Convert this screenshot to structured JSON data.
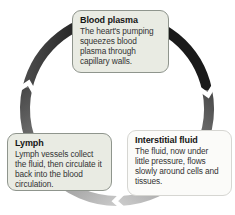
{
  "diagram": {
    "type": "cycle-diagram",
    "cycle_direction": "clockwise",
    "nodes": [
      {
        "id": "blood-plasma",
        "title": "Blood plasma",
        "body": "The heart's pumping squeezes blood plasma through capillary walls."
      },
      {
        "id": "interstitial-fluid",
        "title": "Interstitial fluid",
        "body": "The fluid, now under little pressure, flows slowly around cells and tissues."
      },
      {
        "id": "lymph",
        "title": "Lymph",
        "body": "Lymph vessels collect the fluid, then circulate it back into the blood circulation."
      }
    ],
    "edges": [
      {
        "from": "blood-plasma",
        "to": "interstitial-fluid",
        "side": "right",
        "arrow": "chevron-down"
      },
      {
        "from": "interstitial-fluid",
        "to": "lymph",
        "side": "bottom",
        "arrow": "chevron-left"
      },
      {
        "from": "lymph",
        "to": "blood-plasma",
        "side": "left",
        "arrow": "chevron-up"
      }
    ],
    "colors": {
      "ring_dark": "#1a1a1a",
      "ring_dark_start": "#4a4a4a",
      "ring_mid": "#8c8c8c",
      "ring_light": "#c9c9c9",
      "tinted_box_bg": "#e9ebe3",
      "tinted_box_border": "#8f958d",
      "white_box_bg": "#fbfbf9",
      "white_box_border": "#d6d6d2",
      "title_text": "#151515",
      "body_text": "#333333",
      "background": "#ffffff"
    }
  }
}
